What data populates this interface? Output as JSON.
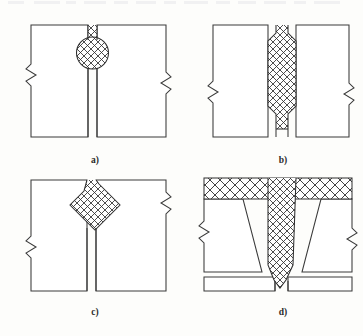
{
  "figure": {
    "kind": "engineering-cross-section-diagram",
    "background_color": "#fdfdfb",
    "line_color": "#3a3a3a",
    "hatch_color": "#2e2e2e",
    "plate_fill": "#ffffff",
    "panel_count": 4
  },
  "panels": [
    {
      "id": "a",
      "caption": "a)",
      "caption_x": 95,
      "caption_y": 163,
      "weld_shape": "circular-bead-with-neck",
      "description": "Butt joint with round weld nugget at top of seam and narrow parallel gap below",
      "has_break_lines": true,
      "break_line_count": 2
    },
    {
      "id": "b",
      "caption": "b)",
      "caption_x": 283,
      "caption_y": 163,
      "weld_shape": "elongated-octagonal-nugget",
      "description": "Butt joint with tall octagonal weld nugget spanning full plate thickness, necked at both ends",
      "has_break_lines": true,
      "break_line_count": 2
    },
    {
      "id": "c",
      "caption": "c)",
      "caption_x": 95,
      "caption_y": 315,
      "weld_shape": "diamond-rhombus-nugget",
      "description": "Butt joint with diamond shaped weld at top of seam and narrow parallel gap below",
      "has_break_lines": true,
      "break_line_count": 2
    },
    {
      "id": "d",
      "caption": "d)",
      "caption_x": 283,
      "caption_y": 315,
      "weld_shape": "tapered-wedge-with-cover-band",
      "description": "Joint with full width hatched cover strip at top and tapered vertical weld between angled bevelled plate edges",
      "has_break_lines": true,
      "break_line_count": 2
    }
  ],
  "scan": {
    "top_artifact_present": true,
    "top_artifact_description": "faint clipped text remnant row along the very top edge of the scan"
  }
}
